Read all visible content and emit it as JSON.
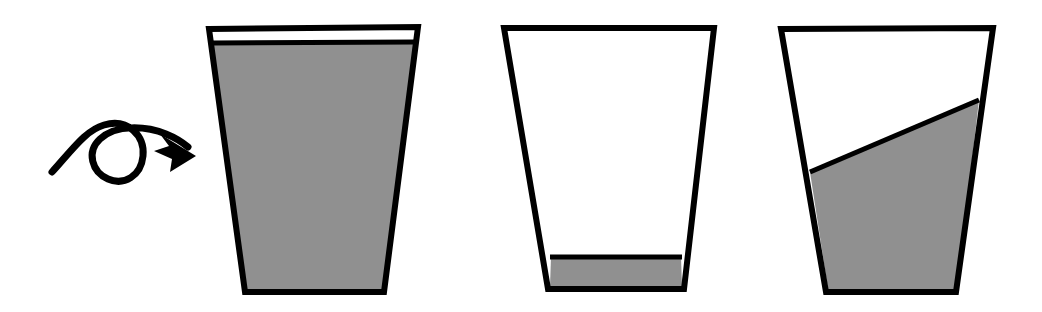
{
  "figure": {
    "canvas": {
      "width": 1042,
      "height": 312
    },
    "background_color": "#ffffff"
  },
  "colors": {
    "outline": "#000000",
    "liquid": "#909090",
    "empty": "#ffffff",
    "arrow": "#000000"
  },
  "strokes": {
    "cup_outline_width": 6,
    "surface_line_width": 5,
    "arrow_width": 7
  },
  "arrow": {
    "label": "rotation-arrow",
    "icon_name": "loop-rotate-arrow-icon",
    "tail_start": {
      "x": 52,
      "y": 172
    },
    "loop_center": {
      "x": 115,
      "y": 152
    },
    "loop_radius": 28,
    "tip": {
      "x": 196,
      "y": 155
    },
    "path": "M 52 172 C 72 150 86 130 104 125 C 128 118 145 136 143 156 C 141 176 124 186 108 179 C 92 172 86 152 100 139 C 116 124 146 126 166 134 C 176 138 182 142 188 147",
    "head_points": "196 156 160 134 169 146 154 151 172 159 170 172"
  },
  "cups": [
    {
      "id": "cup-1",
      "name": "cup-full",
      "fill_state": "full",
      "fill_fraction": 0.95,
      "outline_points": "209 29 418 27 384 292 245 292",
      "liquid_points": "212 43 415 42 383 289 247 289",
      "surface_line": {
        "x1": 212,
        "y1": 43,
        "x2": 415,
        "y2": 42
      },
      "surface_tilt_degrees": 0
    },
    {
      "id": "cup-2",
      "name": "cup-nearly-empty",
      "fill_state": "nearly-empty",
      "fill_fraction": 0.11,
      "outline_points": "504 28 714 28 684 289 548 289",
      "liquid_points": "551 257 681 257 682 286 550 286",
      "surface_line": {
        "x1": 550,
        "y1": 257,
        "x2": 682,
        "y2": 257
      },
      "surface_tilt_degrees": 0
    },
    {
      "id": "cup-3",
      "name": "cup-tilted-surface",
      "fill_state": "tilted-partial",
      "fill_fraction": 0.65,
      "outline_points": "781 29 993 28 956 292 826 292",
      "liquid_points": "810 172 979 100 957 289 828 289",
      "surface_line": {
        "x1": 810,
        "y1": 172,
        "x2": 979,
        "y2": 100
      },
      "surface_tilt_degrees": 23
    }
  ]
}
